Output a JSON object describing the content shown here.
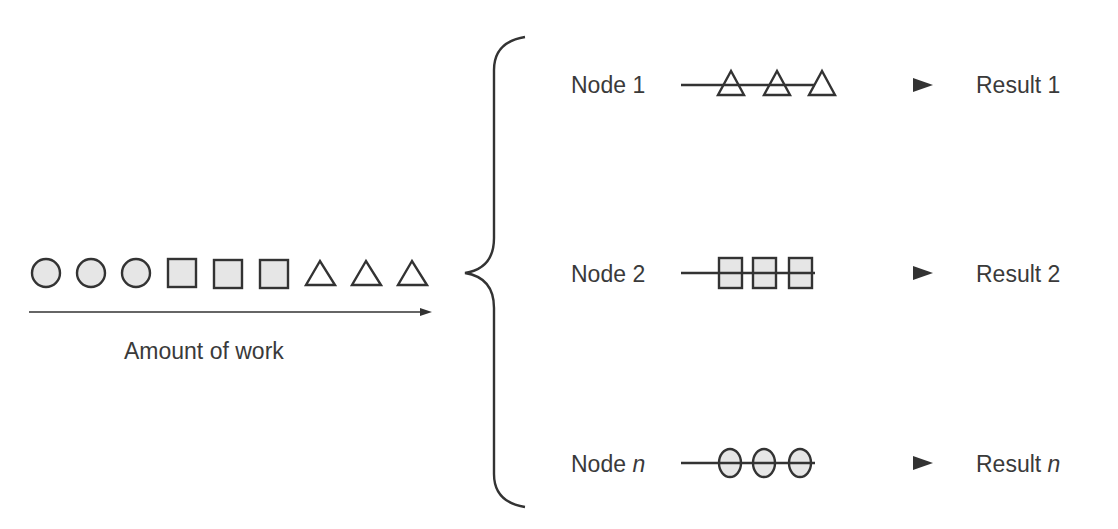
{
  "work_queue": {
    "items": [
      "circle",
      "circle",
      "circle",
      "square",
      "square",
      "square",
      "triangle",
      "triangle",
      "triangle"
    ],
    "axis_label": "Amount of work"
  },
  "nodes": [
    {
      "label_prefix": "Node ",
      "label_suffix": "1",
      "suffix_italic": false,
      "shape": "triangle",
      "count": 3,
      "result_prefix": "Result ",
      "result_suffix": "1"
    },
    {
      "label_prefix": "Node ",
      "label_suffix": "2",
      "suffix_italic": false,
      "shape": "square",
      "count": 3,
      "result_prefix": "Result ",
      "result_suffix": "2"
    },
    {
      "label_prefix": "Node ",
      "label_suffix": "n",
      "suffix_italic": true,
      "shape": "circle",
      "count": 3,
      "result_prefix": "Result ",
      "result_suffix": "n"
    }
  ],
  "colors": {
    "stroke": "#333333",
    "fill": "#e6e6e6",
    "text": "#3a3a3a"
  }
}
